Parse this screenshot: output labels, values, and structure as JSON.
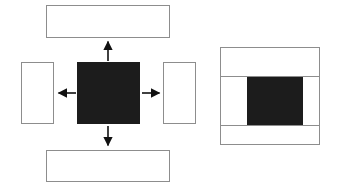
{
  "diagram": {
    "background_color": "#ffffff",
    "stroke_color": "#8d8d8d",
    "fill_color": "#1c1c1c",
    "left_figure": {
      "name": "exploded-view",
      "center_block": {
        "label": "",
        "x": 77,
        "y": 62,
        "w": 63,
        "h": 62,
        "style": "solid"
      },
      "panels": [
        {
          "name": "top-panel",
          "label": "",
          "x": 46,
          "y": 5,
          "w": 124,
          "h": 33,
          "style": "outlined"
        },
        {
          "name": "left-panel",
          "label": "",
          "x": 21,
          "y": 62,
          "w": 33,
          "h": 62,
          "style": "outlined"
        },
        {
          "name": "right-panel",
          "label": "",
          "x": 163,
          "y": 62,
          "w": 33,
          "h": 62,
          "style": "outlined"
        },
        {
          "name": "bottom-panel",
          "label": "",
          "x": 46,
          "y": 150,
          "w": 124,
          "h": 32,
          "style": "outlined"
        }
      ],
      "arrows": [
        {
          "name": "arrow-up",
          "direction": "up",
          "x1": 108,
          "y1": 61,
          "x2": 108,
          "y2": 40
        },
        {
          "name": "arrow-left",
          "direction": "left",
          "x1": 76,
          "y1": 93,
          "x2": 57,
          "y2": 93
        },
        {
          "name": "arrow-right",
          "direction": "right",
          "x1": 142,
          "y1": 93,
          "x2": 161,
          "y2": 93
        },
        {
          "name": "arrow-down",
          "direction": "down",
          "x1": 108,
          "y1": 126,
          "x2": 108,
          "y2": 147
        }
      ]
    },
    "right_figure": {
      "name": "assembled-view",
      "outer_box": {
        "label": "",
        "x": 220,
        "y": 47,
        "w": 100,
        "h": 98,
        "style": "outlined"
      },
      "bands": [
        {
          "name": "top-band",
          "label": "",
          "x": 220,
          "y": 47,
          "w": 100,
          "h": 30,
          "style": "outlined"
        },
        {
          "name": "bottom-band",
          "label": "",
          "x": 220,
          "y": 125,
          "w": 100,
          "h": 20,
          "style": "outlined"
        }
      ],
      "core_block": {
        "name": "core-block",
        "label": "",
        "x": 247,
        "y": 77,
        "w": 56,
        "h": 48,
        "style": "solid"
      }
    }
  }
}
